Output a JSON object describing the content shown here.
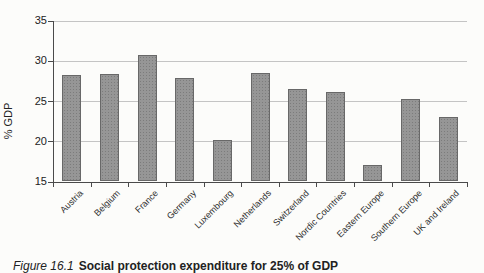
{
  "chart_data": {
    "type": "bar",
    "title": "",
    "xlabel": "",
    "ylabel": "% GDP",
    "categories": [
      "Austria",
      "Belgium",
      "France",
      "Germany",
      "Luxembourg",
      "Netherlands",
      "Switzerland",
      "Nordic Countries",
      "Eastern Europe",
      "Southern Europe",
      "UK and Ireland"
    ],
    "values": [
      28.2,
      28.4,
      30.7,
      27.9,
      20.2,
      28.5,
      26.5,
      26.1,
      17.1,
      25.2,
      23.0
    ],
    "ylim": [
      15,
      35
    ],
    "yticks": [
      15,
      20,
      25,
      30,
      35
    ],
    "gridlines": [
      20,
      25,
      30,
      35
    ],
    "grid": "horizontal",
    "legend_position": "none",
    "bar_color": "#969696",
    "bar_border_color": "#686868",
    "gridline_color": "#c4c4c4",
    "axis_color": "#4a4a4a",
    "background_color": "#fcfcfa"
  },
  "caption": {
    "figure_label": "Figure 16.1",
    "text": "Social protection expenditure for 25% of GDP"
  }
}
